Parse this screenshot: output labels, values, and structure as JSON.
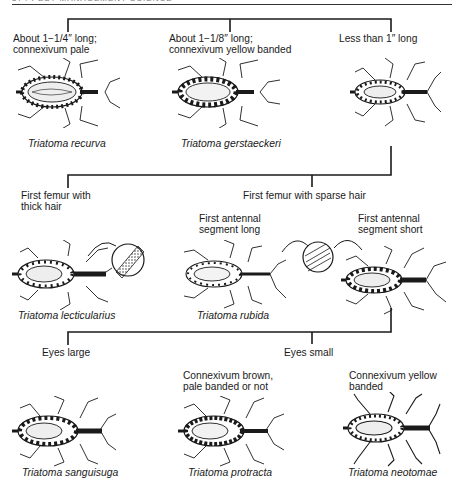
{
  "header": {
    "running_head": "574   PEST MANAGEMENT SCIENCE"
  },
  "key": {
    "level1": {
      "options": [
        {
          "line1": "About 1−1/4″ long;",
          "line2": "connexivum pale",
          "species": "Triatoma recurva"
        },
        {
          "line1": "About 1−1/8″ long;",
          "line2": "connexivum yellow banded",
          "species": "Triatoma gerstaeckeri"
        },
        {
          "line1": "Less than 1″ long",
          "line2": "",
          "species": ""
        }
      ]
    },
    "level2": {
      "options": [
        {
          "line1": "First femur with",
          "line2": "thick hair",
          "species": "Triatoma lecticularius"
        },
        {
          "line1": "First femur with sparse hair",
          "line2": ""
        }
      ]
    },
    "level3": {
      "options": [
        {
          "line1": "First antennal",
          "line2": "segment long",
          "species": "Triatoma rubida"
        },
        {
          "line1": "First antennal",
          "line2": "segment short",
          "species": ""
        }
      ]
    },
    "level4": {
      "options": [
        {
          "line1": "Eyes large",
          "species": "Triatoma sanguisuga"
        },
        {
          "line1": "Eyes small"
        }
      ]
    },
    "level5": {
      "options": [
        {
          "line1": "Connexivum brown,",
          "line2": "pale banded or not",
          "species": "Triatoma protracta"
        },
        {
          "line1": "Connexivum yellow",
          "line2": "banded",
          "species": "Triatoma neotomae"
        }
      ]
    }
  },
  "insets": [
    {
      "name": "thick-hair-femur-detail",
      "pattern": "dense-stippled"
    },
    {
      "name": "sparse-hair-femur-detail",
      "pattern": "sparse-striped"
    }
  ],
  "colors": {
    "ink": "#1a1a1a",
    "paper": "#ffffff"
  }
}
